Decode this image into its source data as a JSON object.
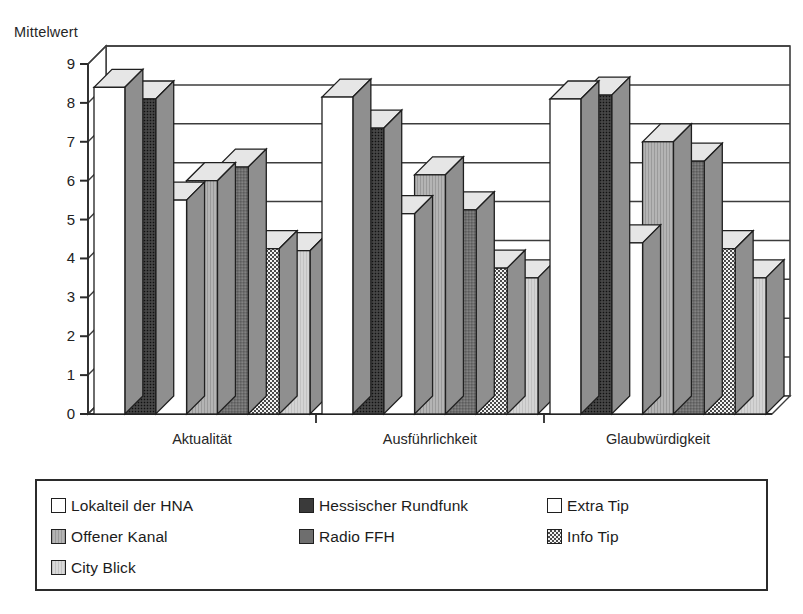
{
  "axis_title": "Mittelwert",
  "legend": {
    "columns": [
      [
        {
          "label": "Lokalteil der HNA",
          "series": "lokalteil_hna"
        },
        {
          "label": "Offener Kanal",
          "series": "offener_kanal"
        },
        {
          "label": "City Blick",
          "series": "city_blick"
        }
      ],
      [
        {
          "label": "Hessischer Rundfunk",
          "series": "hessischer_rundfunk"
        },
        {
          "label": "Radio FFH",
          "series": "radio_ffh"
        }
      ],
      [
        {
          "label": "Extra Tip",
          "series": "extra_tip"
        },
        {
          "label": "Info Tip",
          "series": "info_tip"
        }
      ]
    ]
  },
  "chart_data": {
    "type": "bar",
    "title": "",
    "subtitle": "",
    "xlabel": "",
    "ylabel": "Mittelwert",
    "ylim": [
      0,
      9
    ],
    "ytick_step": 1,
    "yticks": [
      "0",
      "1",
      "2",
      "3",
      "4",
      "5",
      "6",
      "7",
      "8",
      "9"
    ],
    "grid": true,
    "grid_axis": "y",
    "legend_position": "bottom",
    "style_3d": true,
    "categories": [
      "Aktualität",
      "Ausführlichkeit",
      "Glaubwürdigkeit"
    ],
    "series": [
      {
        "name": "Lokalteil der HNA",
        "key": "lokalteil_hna",
        "fill": "#ffffff",
        "pattern": "solid",
        "values": [
          8.4,
          8.15,
          8.1
        ]
      },
      {
        "name": "Hessischer Rundfunk",
        "key": "hessischer_rundfunk",
        "fill": "#3a3a3a",
        "pattern": "dense-dots",
        "values": [
          8.1,
          7.35,
          8.2
        ]
      },
      {
        "name": "Extra Tip",
        "key": "extra_tip",
        "fill": "#ffffff",
        "pattern": "solid",
        "values": [
          5.5,
          5.15,
          4.4
        ]
      },
      {
        "name": "Offener Kanal",
        "key": "offener_kanal",
        "fill": "#adadad",
        "pattern": "vertical-lines",
        "values": [
          6.0,
          6.15,
          7.0
        ]
      },
      {
        "name": "Radio FFH",
        "key": "radio_ffh",
        "fill": "#6e6e6e",
        "pattern": "fine-grid",
        "values": [
          6.35,
          5.25,
          6.5
        ]
      },
      {
        "name": "Info Tip",
        "key": "info_tip",
        "fill": "#e8e8e8",
        "pattern": "checkerboard",
        "values": [
          4.25,
          3.75,
          4.25
        ]
      },
      {
        "name": "City Blick",
        "key": "city_blick",
        "fill": "#cfcfcf",
        "pattern": "light-lines",
        "values": [
          4.2,
          3.5,
          3.5
        ]
      }
    ]
  }
}
